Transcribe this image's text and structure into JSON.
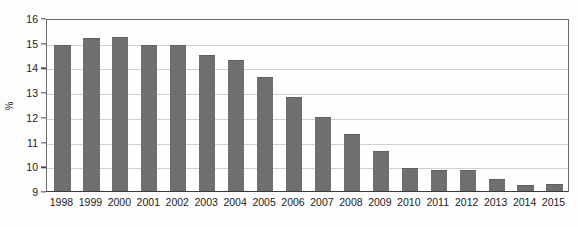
{
  "chart_data": {
    "type": "bar",
    "title": "",
    "xlabel": "",
    "ylabel": "%",
    "ylim": [
      9,
      16
    ],
    "grid": true,
    "legend": "none",
    "y_ticks": [
      "16",
      "15",
      "14",
      "13",
      "12",
      "11",
      "10",
      "9"
    ],
    "y_tick_values": [
      16,
      15,
      14,
      13,
      12,
      11,
      10,
      9
    ],
    "categories": [
      "1998",
      "1999",
      "2000",
      "2001",
      "2002",
      "2003",
      "2004",
      "2005",
      "2006",
      "2007",
      "2008",
      "2009",
      "2010",
      "2011",
      "2012",
      "2013",
      "2014",
      "2015"
    ],
    "values": [
      14.9,
      15.2,
      15.25,
      14.9,
      14.9,
      14.5,
      14.3,
      13.6,
      12.8,
      12.0,
      11.3,
      10.6,
      9.95,
      9.85,
      9.85,
      9.5,
      9.25,
      9.3
    ],
    "bar_color": "#6f6f6f",
    "axis_color": "#3a3a3a",
    "grid_color": "#d0d0d0",
    "background_color": "#fefefe"
  }
}
